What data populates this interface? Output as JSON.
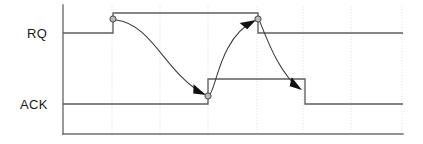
{
  "diagram": {
    "background": "#ffffff",
    "signals": [
      {
        "name": "RQ",
        "label": "RQ",
        "label_x": 27,
        "label_y": 38
      },
      {
        "name": "ACK",
        "label": "ACK",
        "label_x": 20,
        "label_y": 109
      }
    ],
    "axis": {
      "color": "#6e6e6e",
      "x": 63,
      "y_top": 5,
      "y_bottom": 134,
      "x_right": 403
    },
    "gridlines": {
      "color": "#dedede",
      "x_positions": [
        112,
        160,
        208,
        257,
        303,
        351,
        402
      ]
    },
    "levels": {
      "rq_high_y": 13,
      "rq_low_y": 33,
      "ack_high_y": 79,
      "ack_low_y": 104
    },
    "waveforms": [
      {
        "name": "RQ",
        "color": "#5d5d5d",
        "points": "63,33 113,33 113,13 258,13 258,33 403,33"
      },
      {
        "name": "ACK",
        "color": "#5d5d5d",
        "points": "63,104 208,104 208,79 305,79 305,104 403,104"
      }
    ],
    "events": [
      {
        "name": "rq-rising-edge",
        "x": 113,
        "y": 19
      },
      {
        "name": "ack-rising-edge",
        "x": 208,
        "y": 96
      },
      {
        "name": "rq-falling-edge",
        "x": 258,
        "y": 19
      },
      {
        "name": "ack-falling-edge",
        "x": 305,
        "y": 93
      }
    ],
    "causal_arrows": [
      {
        "name": "rq-up-causes-ack-up",
        "path": "M 116 20 C 150 22, 168 78, 205 94",
        "arrow": "200,86 212,97 196,98",
        "arrow_rotate": -205
      },
      {
        "name": "ack-up-causes-rq-down",
        "path": "M 210 95 C 218 96, 222 36, 255 20",
        "arrow": "250,18 259,17 248,31",
        "arrow_rotate": -57
      },
      {
        "name": "rq-down-causes-ack-down",
        "path": "M 260 22 C 268 40, 280 74, 301 89",
        "arrow": "293,82 305,92 290,94",
        "arrow_rotate": -40
      }
    ]
  }
}
